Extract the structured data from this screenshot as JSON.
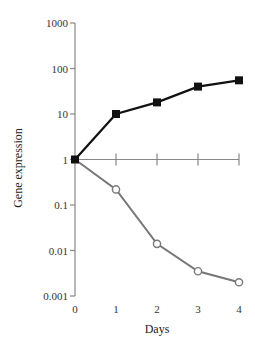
{
  "chart_data": {
    "type": "line",
    "title": "",
    "xlabel": "Days",
    "ylabel": "Gene expression",
    "yscale": "log",
    "ylim": [
      0.001,
      1000
    ],
    "xlim": [
      0,
      4
    ],
    "grid": false,
    "legend": null,
    "x": [
      0,
      1,
      2,
      3,
      4
    ],
    "x_ticks": [
      "0",
      "1",
      "2",
      "3",
      "4"
    ],
    "y_ticks": [
      "1000",
      "100",
      "10",
      "1",
      "0.1",
      "0.01",
      "0.001"
    ],
    "series": [
      {
        "name": "Increasing (filled squares)",
        "marker": "square",
        "color": "#111111",
        "values": [
          1,
          10,
          18,
          40,
          55
        ]
      },
      {
        "name": "Decreasing (open circles)",
        "marker": "circle-open",
        "color": "#777777",
        "values": [
          1,
          0.22,
          0.014,
          0.0035,
          0.002
        ]
      }
    ]
  },
  "colors": {
    "axis": "#888888",
    "series_up": "#111111",
    "series_down": "#777777"
  }
}
